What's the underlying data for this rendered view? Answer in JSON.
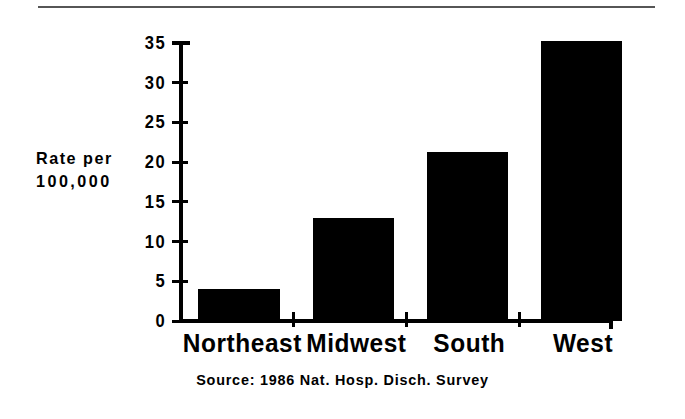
{
  "chart_data": {
    "type": "bar",
    "title": "",
    "subtitle": "",
    "xlabel": "",
    "ylabel": "Rate per 100,000",
    "ylabel_lines": [
      "Rate per",
      "100,000"
    ],
    "categories": [
      "Northeast",
      "Midwest",
      "South",
      "West"
    ],
    "values": [
      4,
      13,
      21.3,
      35.2
    ],
    "ylim": [
      0,
      35
    ],
    "yticks": [
      0,
      5,
      10,
      15,
      20,
      25,
      30,
      35
    ],
    "ytick_labels": [
      "0",
      "5",
      "10",
      "15",
      "20",
      "25",
      "30",
      "35"
    ],
    "grid": false,
    "legend": null,
    "bar_color": "#000000",
    "axis_color": "#000000",
    "background": "#ffffff",
    "source_note": "Source:   1986 Nat. Hosp. Disch. Survey",
    "annotations": []
  },
  "figure": {
    "rule_color": "#565656"
  }
}
